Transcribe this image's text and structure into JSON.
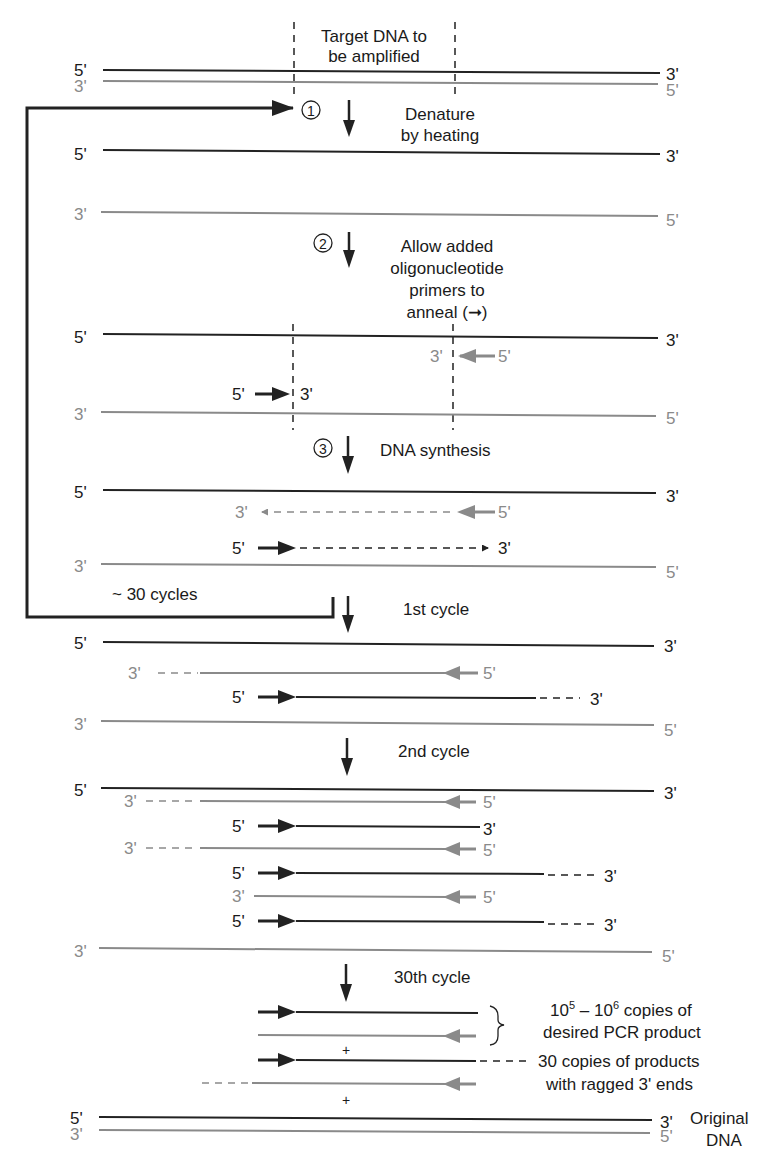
{
  "labels": {
    "target": [
      "Target DNA to",
      "be amplified"
    ],
    "step1": {
      "num": "1",
      "text": [
        "Denature",
        "by heating"
      ]
    },
    "step2": {
      "num": "2",
      "text": [
        "Allow added",
        "oligonucleotide",
        "primers to",
        "anneal (➞)"
      ]
    },
    "step3": {
      "num": "3",
      "text": [
        "DNA synthesis"
      ]
    },
    "cycles_loop": "~ 30 cycles",
    "cycle1": "1st cycle",
    "cycle2": "2nd cycle",
    "cycle30": "30th cycle",
    "desired": [
      "copies of",
      "desired PCR product"
    ],
    "desired_exp": {
      "base1": "10",
      "exp1": "5",
      "dash": " – ",
      "base2": "10",
      "exp2": "6"
    },
    "ragged": [
      "30 copies of products",
      "with ragged 3' ends"
    ],
    "original": [
      "Original",
      "DNA"
    ],
    "plus": "+",
    "five": "5'",
    "three": "3'"
  },
  "colors": {
    "dark_strand": "#222222",
    "light_strand": "#8a8a8a"
  }
}
